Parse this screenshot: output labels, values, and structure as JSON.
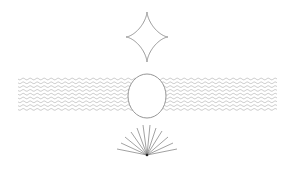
{
  "canvas": {
    "width": 294,
    "height": 173,
    "background": "#ffffff"
  },
  "colors": {
    "stroke": "#8a8a8a",
    "wave": "#b0b0b0",
    "fan": "#7a7a7a",
    "fan_center": "#222222"
  },
  "shapes": {
    "astroid": {
      "cx": 147,
      "cy": 37,
      "rx": 21,
      "ry": 25
    },
    "waves": {
      "x_start": 18,
      "x_end": 277,
      "y_start": 79,
      "count": 9,
      "spacing": 3.8,
      "amplitude": 0.8,
      "wavelength": 7
    },
    "ellipse": {
      "cx": 147,
      "cy": 96,
      "rx": 19,
      "ry": 22
    },
    "fan": {
      "origin": [
        147,
        155
      ],
      "ends": [
        [
          117,
          149
        ],
        [
          121,
          143
        ],
        [
          125,
          137
        ],
        [
          131,
          132
        ],
        [
          137,
          128
        ],
        [
          143,
          125
        ],
        [
          150,
          125
        ],
        [
          156,
          128
        ],
        [
          162,
          131
        ],
        [
          168,
          137
        ],
        [
          173,
          143
        ],
        [
          177,
          149
        ]
      ]
    }
  }
}
